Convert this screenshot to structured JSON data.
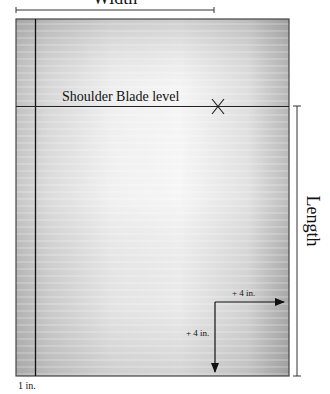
{
  "diagram": {
    "labels": {
      "width": "Width",
      "length": "Length",
      "shoulder": "Shoulder Blade level",
      "one_inch": "1 in.",
      "plus_horizontal": "+ 4 in.",
      "plus_vertical": "+ 4 in."
    },
    "marker": "X",
    "colors": {
      "line": "#222222",
      "fabric_light": "#f2f2f2",
      "fabric_dark": "#a9a9a9"
    }
  }
}
